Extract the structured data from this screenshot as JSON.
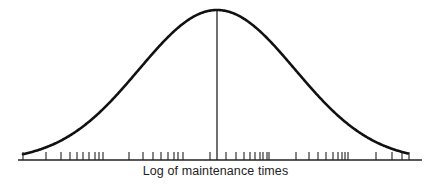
{
  "chart_data": {
    "type": "line",
    "title": "",
    "xlabel": "Log of maintenance times",
    "ylabel": "",
    "curve": {
      "shape": "normal",
      "peak_x_px": 217,
      "peak_y_px": 10,
      "start": [
        23,
        150
      ],
      "end": [
        408,
        153
      ],
      "stroke": "#111111"
    },
    "center_line_x_px": 217,
    "axis": {
      "x1": 18,
      "x2": 422,
      "y": 160
    },
    "ticks_px": [
      23,
      46,
      61,
      70,
      77,
      83,
      89,
      95,
      99,
      103,
      129,
      143,
      153,
      161,
      168,
      174,
      178,
      183,
      210,
      226,
      236,
      244,
      250,
      255,
      260,
      263,
      267,
      269,
      296,
      309,
      318,
      326,
      333,
      338,
      342,
      345,
      348,
      376,
      392,
      402,
      409
    ],
    "grid": false,
    "legend": null
  },
  "colors": {
    "ink": "#111111",
    "background": "#ffffff",
    "label": "#222222"
  }
}
